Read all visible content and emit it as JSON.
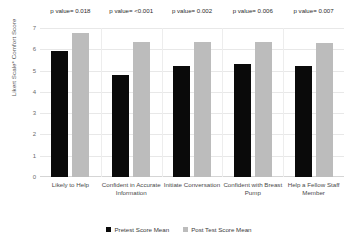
{
  "chart_data": {
    "type": "bar",
    "title": "",
    "xlabel": "",
    "ylabel": "Likert Scale* Comfort Score",
    "ylim": [
      0,
      7
    ],
    "yticks": [
      "0",
      "1",
      "2",
      "3",
      "4",
      "5",
      "6",
      "7"
    ],
    "grid": true,
    "legend_position": "bottom",
    "categories": [
      "Likely to Help",
      "Confident in Accurate Information",
      "Initiate Conversation",
      "Confident with Breast Pump",
      "Help a Fellow Staff Member"
    ],
    "series": [
      {
        "name": "Pretest Score Mean",
        "color": "#0a0a0a",
        "values": [
          5.9,
          4.8,
          5.2,
          5.3,
          5.2
        ]
      },
      {
        "name": "Post Test Score Mean",
        "color": "#bcbcbc",
        "values": [
          6.75,
          6.35,
          6.35,
          6.35,
          6.3
        ]
      }
    ],
    "annotations": [
      "p value= 0.018",
      "p value= <0.001",
      "p value= 0.002",
      "p value= 0.006",
      "p value= 0.007"
    ]
  }
}
